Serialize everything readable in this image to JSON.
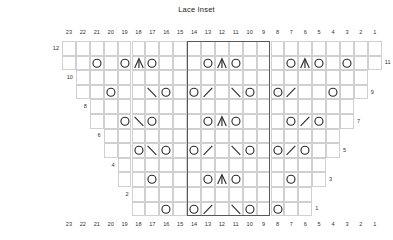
{
  "chart": {
    "title": "Lace Inset",
    "type": "knitting-chart",
    "columns": 23,
    "rows": 12,
    "column_numbers": [
      23,
      22,
      21,
      20,
      19,
      18,
      17,
      16,
      15,
      14,
      13,
      12,
      11,
      10,
      9,
      8,
      7,
      6,
      5,
      4,
      3,
      2,
      1
    ],
    "row_numbers_left": [
      12,
      10,
      8,
      6,
      4,
      2
    ],
    "row_numbers_right": [
      11,
      9,
      7,
      5,
      3,
      1
    ],
    "repeat": {
      "label": "pattern repeat",
      "from_col": 14,
      "to_col": 9
    },
    "symbols": {
      "yo": {
        "name": "yarn-over",
        "glyph": "O"
      },
      "cdd": {
        "name": "central-double-decrease",
        "glyph": "∧"
      },
      "k2tog": {
        "name": "k2tog-right-leaning",
        "glyph": "\\"
      },
      "ssk": {
        "name": "ssk-left-leaning",
        "glyph": "/"
      }
    },
    "row_extent": {
      "12": [
        23,
        1
      ],
      "11": [
        23,
        1
      ],
      "10": [
        22,
        2
      ],
      "9": [
        22,
        2
      ],
      "8": [
        21,
        3
      ],
      "7": [
        21,
        3
      ],
      "6": [
        20,
        4
      ],
      "5": [
        20,
        4
      ],
      "4": [
        19,
        5
      ],
      "3": [
        19,
        5
      ],
      "2": [
        18,
        6
      ],
      "1": [
        18,
        6
      ]
    },
    "stitches": [
      {
        "row": 11,
        "col": 21,
        "sym": "yo"
      },
      {
        "row": 11,
        "col": 19,
        "sym": "yo"
      },
      {
        "row": 11,
        "col": 18,
        "sym": "cdd"
      },
      {
        "row": 11,
        "col": 17,
        "sym": "yo"
      },
      {
        "row": 11,
        "col": 13,
        "sym": "yo"
      },
      {
        "row": 11,
        "col": 12,
        "sym": "cdd"
      },
      {
        "row": 11,
        "col": 11,
        "sym": "yo"
      },
      {
        "row": 11,
        "col": 7,
        "sym": "yo"
      },
      {
        "row": 11,
        "col": 6,
        "sym": "cdd"
      },
      {
        "row": 11,
        "col": 5,
        "sym": "yo"
      },
      {
        "row": 11,
        "col": 3,
        "sym": "yo"
      },
      {
        "row": 9,
        "col": 20,
        "sym": "yo"
      },
      {
        "row": 9,
        "col": 17,
        "sym": "k2tog"
      },
      {
        "row": 9,
        "col": 16,
        "sym": "yo"
      },
      {
        "row": 9,
        "col": 14,
        "sym": "yo"
      },
      {
        "row": 9,
        "col": 13,
        "sym": "ssk"
      },
      {
        "row": 9,
        "col": 11,
        "sym": "k2tog"
      },
      {
        "row": 9,
        "col": 10,
        "sym": "yo"
      },
      {
        "row": 9,
        "col": 8,
        "sym": "yo"
      },
      {
        "row": 9,
        "col": 7,
        "sym": "ssk"
      },
      {
        "row": 9,
        "col": 4,
        "sym": "yo"
      },
      {
        "row": 7,
        "col": 19,
        "sym": "yo"
      },
      {
        "row": 7,
        "col": 18,
        "sym": "k2tog"
      },
      {
        "row": 7,
        "col": 17,
        "sym": "yo"
      },
      {
        "row": 7,
        "col": 13,
        "sym": "yo"
      },
      {
        "row": 7,
        "col": 12,
        "sym": "cdd"
      },
      {
        "row": 7,
        "col": 11,
        "sym": "yo"
      },
      {
        "row": 7,
        "col": 7,
        "sym": "yo"
      },
      {
        "row": 7,
        "col": 6,
        "sym": "ssk"
      },
      {
        "row": 7,
        "col": 5,
        "sym": "yo"
      },
      {
        "row": 5,
        "col": 18,
        "sym": "yo"
      },
      {
        "row": 5,
        "col": 17,
        "sym": "k2tog"
      },
      {
        "row": 5,
        "col": 16,
        "sym": "yo"
      },
      {
        "row": 5,
        "col": 14,
        "sym": "yo"
      },
      {
        "row": 5,
        "col": 13,
        "sym": "ssk"
      },
      {
        "row": 5,
        "col": 11,
        "sym": "k2tog"
      },
      {
        "row": 5,
        "col": 10,
        "sym": "yo"
      },
      {
        "row": 5,
        "col": 8,
        "sym": "yo"
      },
      {
        "row": 5,
        "col": 7,
        "sym": "ssk"
      },
      {
        "row": 5,
        "col": 6,
        "sym": "yo"
      },
      {
        "row": 3,
        "col": 17,
        "sym": "yo"
      },
      {
        "row": 3,
        "col": 13,
        "sym": "yo"
      },
      {
        "row": 3,
        "col": 12,
        "sym": "cdd"
      },
      {
        "row": 3,
        "col": 11,
        "sym": "yo"
      },
      {
        "row": 3,
        "col": 7,
        "sym": "yo"
      },
      {
        "row": 1,
        "col": 16,
        "sym": "yo"
      },
      {
        "row": 1,
        "col": 14,
        "sym": "yo"
      },
      {
        "row": 1,
        "col": 13,
        "sym": "ssk"
      },
      {
        "row": 1,
        "col": 11,
        "sym": "k2tog"
      },
      {
        "row": 1,
        "col": 10,
        "sym": "yo"
      },
      {
        "row": 1,
        "col": 8,
        "sym": "yo"
      }
    ]
  },
  "style": {
    "grid_line": "#d0d0d0",
    "repeat_border": "#595959",
    "symbol_color": "#2b2b2b",
    "text_color": "#333333"
  }
}
